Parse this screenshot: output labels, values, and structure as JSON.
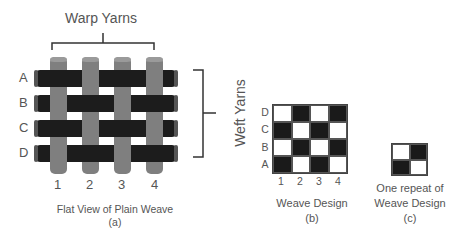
{
  "figure_a": {
    "warp_title": "Warp Yarns",
    "weft_title": "Weft Yarns",
    "row_labels": [
      "A",
      "B",
      "C",
      "D"
    ],
    "col_labels": [
      "1",
      "2",
      "3",
      "4"
    ],
    "caption": "Flat View of Plain Weave",
    "sub_label": "(a)",
    "colors": {
      "warp": "#7f7f7f",
      "weft": "#1c1c1c"
    }
  },
  "figure_b": {
    "row_labels": [
      "D",
      "C",
      "B",
      "A"
    ],
    "col_labels": [
      "1",
      "2",
      "3",
      "4"
    ],
    "grid": [
      [
        0,
        1,
        0,
        1
      ],
      [
        1,
        0,
        1,
        0
      ],
      [
        0,
        1,
        0,
        1
      ],
      [
        1,
        0,
        1,
        0
      ]
    ],
    "caption": "Weave Design",
    "sub_label": "(b)"
  },
  "figure_c": {
    "grid": [
      [
        0,
        1
      ],
      [
        1,
        0
      ]
    ],
    "caption_line1": "One repeat of",
    "caption_line2": "Weave Design",
    "sub_label": "(c)"
  }
}
